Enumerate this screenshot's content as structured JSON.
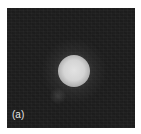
{
  "figure": {
    "panel_label": "(a)",
    "colors": {
      "background": "#1e1e1e",
      "spot_core": "#e2e2e2",
      "label": "#e8e8e8"
    }
  }
}
